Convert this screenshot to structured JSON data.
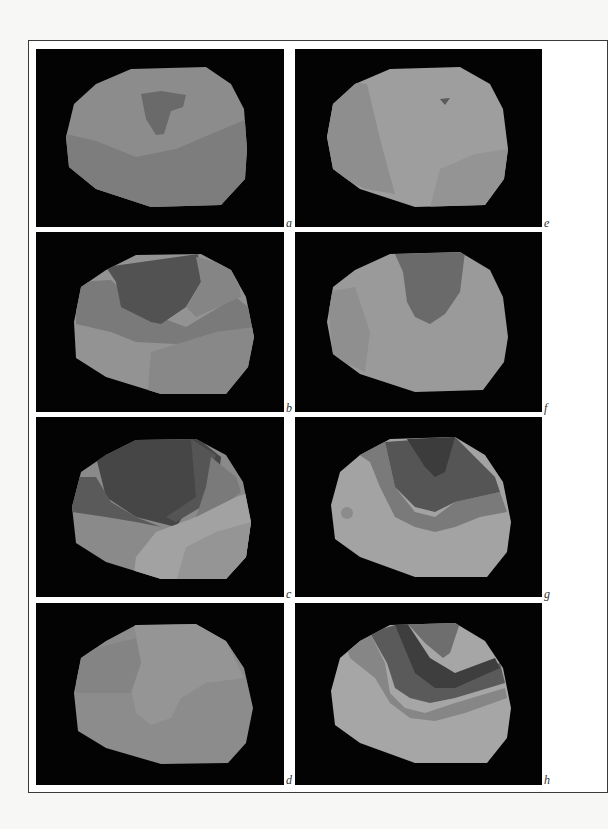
{
  "figure": {
    "panels": [
      {
        "id": "a",
        "label": "a",
        "x": 36,
        "y": 49,
        "w": 248,
        "h": 178
      },
      {
        "id": "b",
        "label": "b",
        "x": 36,
        "y": 232,
        "w": 248,
        "h": 180
      },
      {
        "id": "c",
        "label": "c",
        "x": 36,
        "y": 417,
        "w": 248,
        "h": 180
      },
      {
        "id": "d",
        "label": "d",
        "x": 36,
        "y": 603,
        "w": 248,
        "h": 182
      },
      {
        "id": "e",
        "label": "e",
        "x": 295,
        "y": 49,
        "w": 247,
        "h": 178
      },
      {
        "id": "f",
        "label": "f",
        "x": 295,
        "y": 232,
        "w": 247,
        "h": 180
      },
      {
        "id": "g",
        "label": "g",
        "x": 295,
        "y": 417,
        "w": 247,
        "h": 180
      },
      {
        "id": "h",
        "label": "h",
        "x": 295,
        "y": 603,
        "w": 247,
        "h": 182
      }
    ],
    "colors": {
      "background": "#030303",
      "level1": "#3c3c3c",
      "level2": "#545454",
      "level3": "#6c6c6c",
      "level4": "#848484",
      "level5": "#989898",
      "level6": "#a9a9a9"
    }
  }
}
